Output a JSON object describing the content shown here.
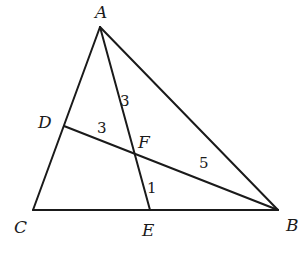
{
  "diagram": {
    "points": {
      "A": {
        "label": "A",
        "x": 100,
        "y": 27,
        "lx": 95,
        "ly": 18
      },
      "B": {
        "label": "B",
        "x": 278,
        "y": 210,
        "lx": 286,
        "ly": 231
      },
      "C": {
        "label": "C",
        "x": 33,
        "y": 210,
        "lx": 14,
        "ly": 233
      },
      "D": {
        "label": "D",
        "x": 64,
        "y": 126,
        "lx": 38,
        "ly": 128
      },
      "E": {
        "label": "E",
        "x": 150,
        "y": 210,
        "lx": 142,
        "ly": 236
      },
      "F": {
        "label": "F",
        "x": 135,
        "y": 152,
        "lx": 138,
        "ly": 148
      }
    },
    "segments": [
      {
        "from": "A",
        "to": "B"
      },
      {
        "from": "A",
        "to": "C"
      },
      {
        "from": "C",
        "to": "B"
      },
      {
        "from": "A",
        "to": "E"
      },
      {
        "from": "D",
        "to": "B"
      }
    ],
    "lengths": [
      {
        "segment": "AF",
        "text": "3",
        "x": 120,
        "y": 106
      },
      {
        "segment": "DF",
        "text": "3",
        "x": 97,
        "y": 133
      },
      {
        "segment": "FB",
        "text": "5",
        "x": 199,
        "y": 168
      },
      {
        "segment": "FE",
        "text": "1",
        "x": 147,
        "y": 193
      }
    ]
  }
}
